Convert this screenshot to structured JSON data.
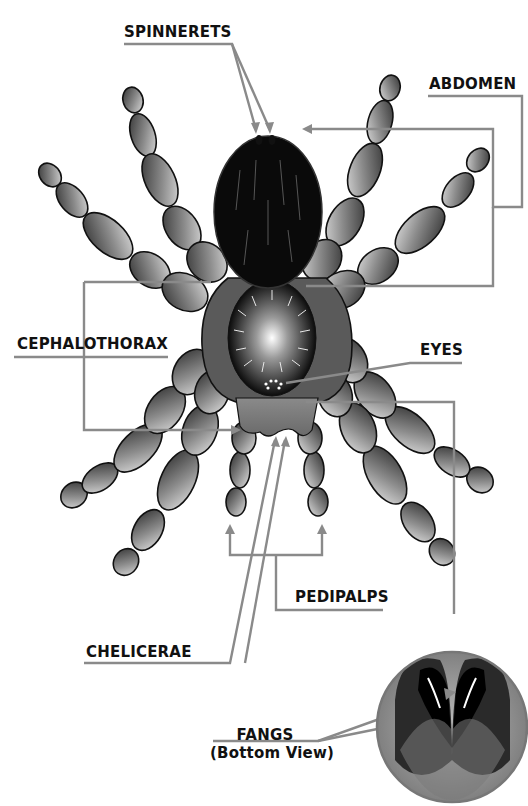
{
  "diagram": {
    "colors": {
      "leader_line": "#8a8a8a",
      "label_text": "#111111",
      "abdomen": "#0a0a0a",
      "leg_dark": "#2a2a2a",
      "leg_light": "#d8d8d8",
      "carapace": "#555555",
      "inset_background": "#9a9a9a"
    },
    "labels": {
      "spinnerets": "SPINNERETS",
      "abdomen": "ABDOMEN",
      "cephalothorax": "CEPHALOTHORAX",
      "eyes": "EYES",
      "pedipalps": "PEDIPALPS",
      "chelicerae": "CHELICERAE",
      "fangs_line1": "FANGS",
      "fangs_line2": "(Bottom View)"
    },
    "inset": {
      "title": "Fangs bottom view inset"
    }
  }
}
